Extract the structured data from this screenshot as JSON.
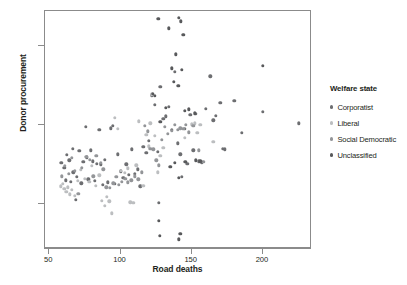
{
  "chart_data": {
    "type": "scatter",
    "title": "",
    "xlabel": "Road deaths",
    "ylabel": "Donor procurement",
    "xlim": [
      47,
      233
    ],
    "ylim": [
      4.5,
      34.5
    ],
    "xticks": [
      50,
      100,
      150,
      200
    ],
    "yticks": [
      10,
      20,
      30
    ],
    "grid": false,
    "legend_title": "Welfare state",
    "legend_position": "right",
    "series": [
      {
        "name": "Corporatist",
        "color": "#6d6e71",
        "points": [
          [
            58.5,
            15.2
          ],
          [
            60.5,
            14.6
          ],
          [
            61.5,
            13.0
          ],
          [
            62.5,
            16.2
          ],
          [
            64.0,
            15.5
          ],
          [
            65.0,
            12.8
          ],
          [
            66.5,
            17.0
          ],
          [
            67.0,
            14.0
          ],
          [
            68.5,
            10.5
          ],
          [
            69.5,
            13.4
          ],
          [
            71.0,
            16.7
          ],
          [
            72.5,
            12.6
          ],
          [
            74.0,
            15.3
          ],
          [
            75.5,
            19.8
          ],
          [
            76.5,
            15.9
          ],
          [
            77.5,
            13.1
          ],
          [
            79.0,
            16.8
          ],
          [
            80.5,
            15.4
          ],
          [
            82.0,
            12.9
          ],
          [
            83.5,
            15.1
          ],
          [
            85.0,
            19.4
          ],
          [
            86.0,
            15.0
          ],
          [
            87.5,
            12.4
          ],
          [
            89.0,
            15.6
          ],
          [
            91.0,
            12.7
          ],
          [
            93.0,
            19.6
          ],
          [
            94.5,
            19.9
          ],
          [
            96.0,
            12.5
          ],
          [
            98.0,
            16.3
          ],
          [
            100.0,
            14.1
          ],
          [
            102.0,
            13.3
          ],
          [
            104.0,
            15.0
          ],
          [
            106.0,
            13.7
          ],
          [
            108.0,
            16.9
          ],
          [
            110.0,
            13.8
          ],
          [
            112.0,
            14.4
          ],
          [
            114.0,
            12.2
          ],
          [
            116.0,
            17.2
          ],
          [
            118.0,
            16.5
          ],
          [
            120.0,
            18.0
          ],
          [
            122.0,
            23.8
          ],
          [
            124.0,
            22.6
          ],
          [
            126.0,
            16.6
          ],
          [
            127.0,
            10.1
          ],
          [
            128.0,
            24.9
          ],
          [
            130.0,
            20.8
          ],
          [
            132.0,
            21.1
          ],
          [
            134.0,
            22.3
          ],
          [
            136.0,
            19.4
          ],
          [
            138.0,
            26.8
          ],
          [
            140.0,
            17.7
          ],
          [
            142.0,
            16.3
          ],
          [
            143.0,
            13.4
          ],
          [
            145.0,
            19.5
          ],
          [
            147.0,
            15.1
          ],
          [
            149.0,
            21.3
          ],
          [
            151.0,
            16.8
          ],
          [
            153.0,
            21.4
          ],
          [
            155.0,
            15.4
          ],
          [
            157.0,
            15.2
          ],
          [
            160.0,
            22.1
          ],
          [
            163.0,
            26.2
          ],
          [
            165.0,
            20.6
          ],
          [
            167.0,
            21.2
          ],
          [
            170.0,
            22.8
          ],
          [
            172.0,
            17.0
          ],
          [
            173.0,
            16.9
          ],
          [
            180.0,
            23.1
          ],
          [
            185.0,
            19.0
          ],
          [
            200.0,
            21.7
          ],
          [
            225.0,
            20.2
          ]
        ]
      },
      {
        "name": "Liberal",
        "color": "#bcbec0",
        "points": [
          [
            58.0,
            12.2
          ],
          [
            59.5,
            12.5
          ],
          [
            60.5,
            11.9
          ],
          [
            62.0,
            11.5
          ],
          [
            63.0,
            12.1
          ],
          [
            64.5,
            11.2
          ],
          [
            66.0,
            11.8
          ],
          [
            68.0,
            11.0
          ],
          [
            70.0,
            12.9
          ],
          [
            72.0,
            14.3
          ],
          [
            75.0,
            13.2
          ],
          [
            78.0,
            12.8
          ],
          [
            80.0,
            14.8
          ],
          [
            82.5,
            12.3
          ],
          [
            85.0,
            13.6
          ],
          [
            87.0,
            10.4
          ],
          [
            89.0,
            9.7
          ],
          [
            90.5,
            10.9
          ],
          [
            92.0,
            10.3
          ],
          [
            94.0,
            8.8
          ],
          [
            96.0,
            20.9
          ],
          [
            98.0,
            19.5
          ],
          [
            100.0,
            14.2
          ],
          [
            103.0,
            13.9
          ],
          [
            105.0,
            14.5
          ],
          [
            107.0,
            10.2
          ],
          [
            109.0,
            10.1
          ],
          [
            111.0,
            14.9
          ],
          [
            113.0,
            20.5
          ],
          [
            116.0,
            12.3
          ],
          [
            118.0,
            18.8
          ],
          [
            120.0,
            17.3
          ],
          [
            121.0,
            20.2
          ],
          [
            122.0,
            23.9
          ],
          [
            124.0,
            18.6
          ],
          [
            126.0,
            14.0
          ],
          [
            128.0,
            16.1
          ],
          [
            130.0,
            17.1
          ],
          [
            145.0,
            18.4
          ],
          [
            150.0,
            20.1
          ],
          [
            152.0,
            20.2
          ],
          [
            154.0,
            19.0
          ],
          [
            156.0,
            20.0
          ],
          [
            165.0,
            17.9
          ]
        ]
      },
      {
        "name": "Social Democratic",
        "color": "#939598",
        "points": [
          [
            59.0,
            13.5
          ],
          [
            61.0,
            14.8
          ],
          [
            63.5,
            13.8
          ],
          [
            66.0,
            15.8
          ],
          [
            68.0,
            14.2
          ],
          [
            70.5,
            11.3
          ],
          [
            73.0,
            14.6
          ],
          [
            76.0,
            16.0
          ],
          [
            78.5,
            15.6
          ],
          [
            81.0,
            13.5
          ],
          [
            83.0,
            16.1
          ],
          [
            86.0,
            15.2
          ],
          [
            88.0,
            14.4
          ],
          [
            90.0,
            12.1
          ],
          [
            92.5,
            12.0
          ],
          [
            95.0,
            12.6
          ],
          [
            97.0,
            13.4
          ],
          [
            99.0,
            12.4
          ],
          [
            101.0,
            12.8
          ],
          [
            103.5,
            13.2
          ],
          [
            105.0,
            12.7
          ],
          [
            107.5,
            13.0
          ],
          [
            110.0,
            13.5
          ],
          [
            112.5,
            13.1
          ],
          [
            115.0,
            14.0
          ],
          [
            117.0,
            19.9
          ],
          [
            119.0,
            19.2
          ],
          [
            121.0,
            17.0
          ],
          [
            123.0,
            16.9
          ],
          [
            125.0,
            15.5
          ],
          [
            127.0,
            14.9
          ],
          [
            129.0,
            18.1
          ],
          [
            131.0,
            19.8
          ],
          [
            133.0,
            18.9
          ],
          [
            136.0,
            19.3
          ],
          [
            138.0,
            20.0
          ],
          [
            140.0,
            19.4
          ],
          [
            142.0,
            19.6
          ],
          [
            144.0,
            19.5
          ],
          [
            146.0,
            20.0
          ],
          [
            148.0,
            19.1
          ],
          [
            151.0,
            19.9
          ],
          [
            155.0,
            16.8
          ],
          [
            158.0,
            15.3
          ]
        ]
      },
      {
        "name": "Unclassified",
        "color": "#58595b",
        "points": [
          [
            126.5,
            33.5
          ],
          [
            134.0,
            32.3
          ],
          [
            141.0,
            33.6
          ],
          [
            142.5,
            33.2
          ],
          [
            144.0,
            31.5
          ],
          [
            139.0,
            29.0
          ],
          [
            136.0,
            27.2
          ],
          [
            143.0,
            27.0
          ],
          [
            137.5,
            25.5
          ],
          [
            140.5,
            25.0
          ],
          [
            132.0,
            22.2
          ],
          [
            128.0,
            20.4
          ],
          [
            124.0,
            23.7
          ],
          [
            122.5,
            24.0
          ],
          [
            145.0,
            21.8
          ],
          [
            148.0,
            22.0
          ],
          [
            152.0,
            21.5
          ],
          [
            135.0,
            14.7
          ],
          [
            141.0,
            13.3
          ],
          [
            138.0,
            15.2
          ],
          [
            145.5,
            15.3
          ],
          [
            153.0,
            15.5
          ],
          [
            156.0,
            15.4
          ],
          [
            127.0,
            7.8
          ],
          [
            127.5,
            5.9
          ],
          [
            141.0,
            5.5
          ],
          [
            142.0,
            6.2
          ],
          [
            200.0,
            27.5
          ]
        ]
      }
    ]
  },
  "axes": {
    "x_tick_labels": [
      "50",
      "100",
      "150",
      "200"
    ],
    "y_tick_labels": [
      "10",
      "20",
      "30"
    ]
  }
}
